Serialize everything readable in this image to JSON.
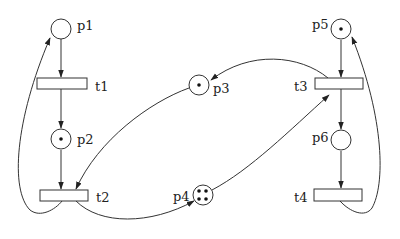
{
  "diagram": {
    "type": "petri-net",
    "places": [
      {
        "id": "p1",
        "label": "p1",
        "tokens": 0
      },
      {
        "id": "p2",
        "label": "p2",
        "tokens": 1
      },
      {
        "id": "p3",
        "label": "p3",
        "tokens": 1
      },
      {
        "id": "p4",
        "label": "p4",
        "tokens": 4
      },
      {
        "id": "p5",
        "label": "p5",
        "tokens": 1
      },
      {
        "id": "p6",
        "label": "p6",
        "tokens": 0
      }
    ],
    "transitions": [
      {
        "id": "t1",
        "label": "t1"
      },
      {
        "id": "t2",
        "label": "t2"
      },
      {
        "id": "t3",
        "label": "t3"
      },
      {
        "id": "t4",
        "label": "t4"
      }
    ],
    "arcs": [
      {
        "from": "p1",
        "to": "t1"
      },
      {
        "from": "t1",
        "to": "p2"
      },
      {
        "from": "p2",
        "to": "t2"
      },
      {
        "from": "p3",
        "to": "t2"
      },
      {
        "from": "t2",
        "to": "p1"
      },
      {
        "from": "t2",
        "to": "p4"
      },
      {
        "from": "p4",
        "to": "t3"
      },
      {
        "from": "t3",
        "to": "p3"
      },
      {
        "from": "p5",
        "to": "t3"
      },
      {
        "from": "t3",
        "to": "p6"
      },
      {
        "from": "p6",
        "to": "t4"
      },
      {
        "from": "t4",
        "to": "p5"
      }
    ]
  }
}
